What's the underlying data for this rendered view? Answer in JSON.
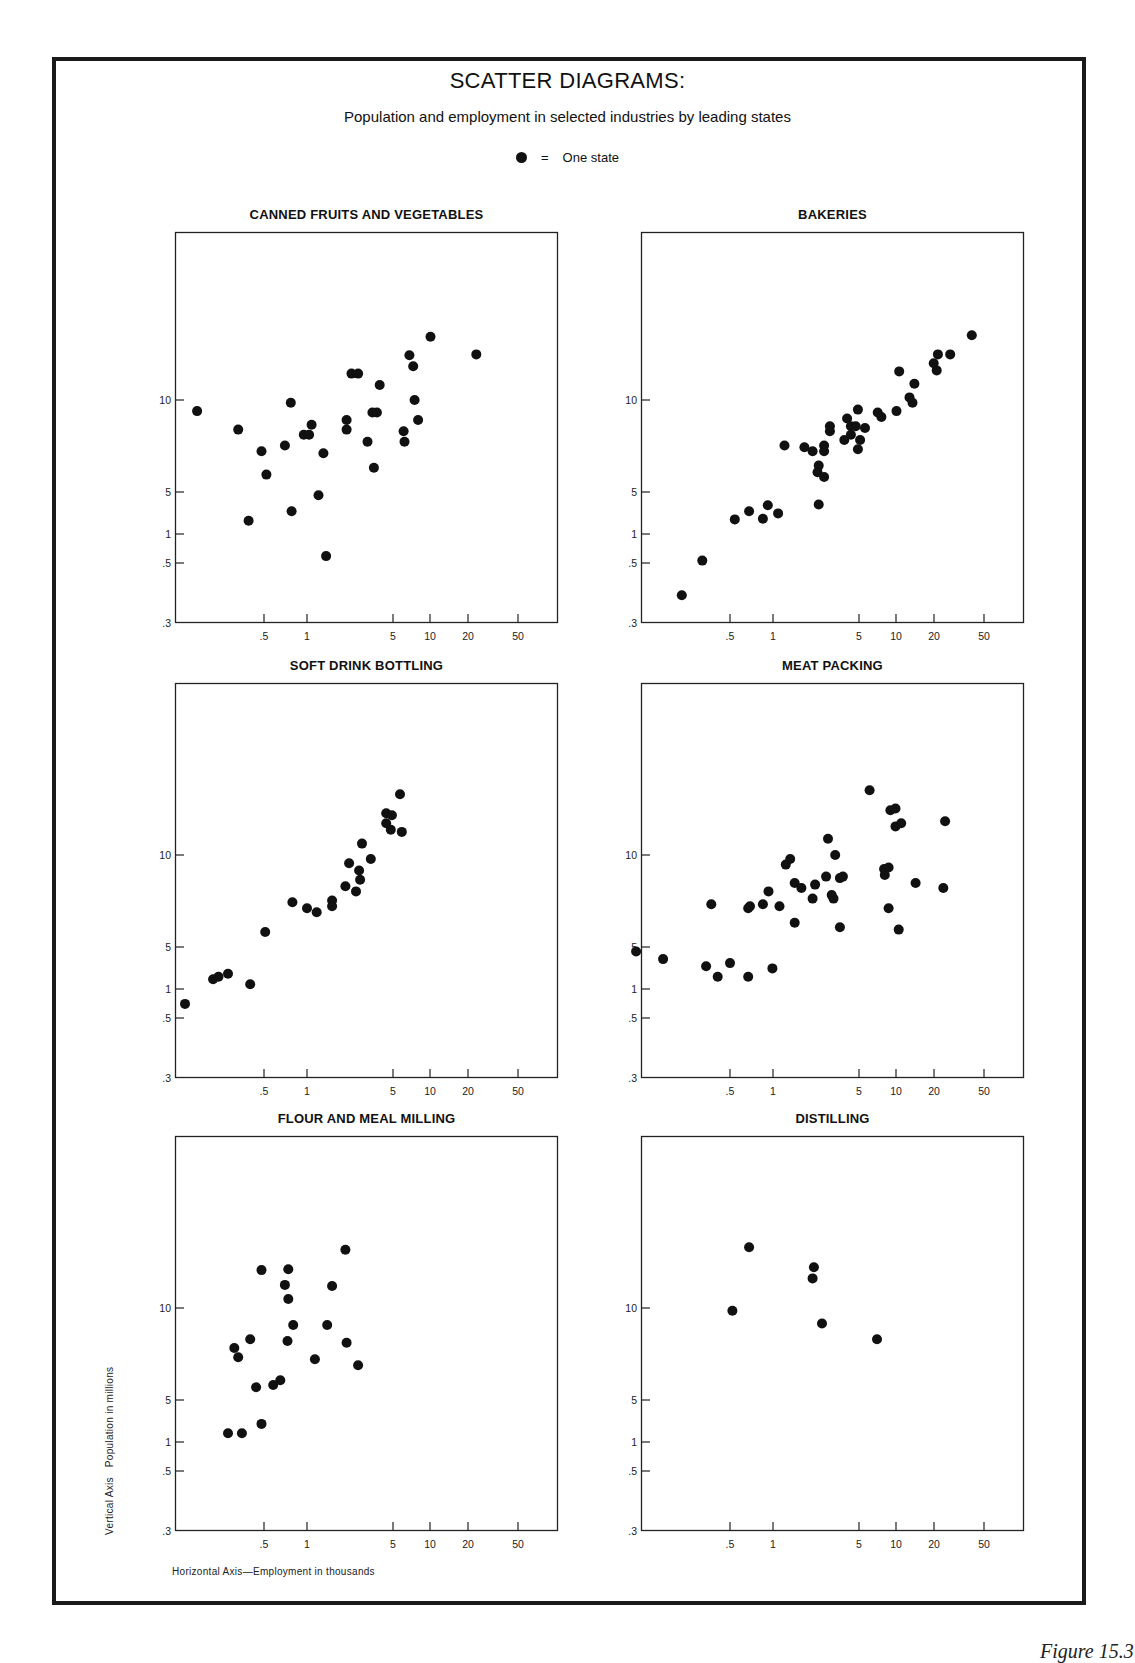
{
  "header": {
    "title": "SCATTER DIAGRAMS:",
    "subtitle": "Population and employment in selected industries by leading states",
    "legend_symbol": "●",
    "legend_equals": "=",
    "legend_label": "One state"
  },
  "axis_labels": {
    "vertical_axis": "Vertical Axis",
    "vertical_desc": "Population in millions",
    "horizontal": "Horizontal Axis—Employment in thousands"
  },
  "figure_caption": "Figure 15.3",
  "colors": {
    "ink": "#111111",
    "frame": "#1a1a1a",
    "background": "#ffffff"
  },
  "chart_data": [
    {
      "type": "scatter",
      "title": "CANNED FRUITS AND VEGETABLES",
      "xlabel": "Employment in thousands",
      "ylabel": "Population in millions",
      "x_ticks": [
        ".5",
        "1",
        "5",
        "10",
        "20",
        "50"
      ],
      "y_ticks": [
        ".3",
        ".5",
        "1",
        "5",
        "10"
      ],
      "points": [
        [
          0.17,
          9.2
        ],
        [
          0.33,
          8.0
        ],
        [
          0.48,
          6.8
        ],
        [
          0.52,
          5.7
        ],
        [
          0.39,
          1.66
        ],
        [
          0.77,
          9.8
        ],
        [
          0.7,
          7.1
        ],
        [
          0.78,
          2.4
        ],
        [
          0.95,
          7.7
        ],
        [
          1.04,
          7.7
        ],
        [
          1.09,
          8.3
        ],
        [
          1.36,
          6.7
        ],
        [
          1.24,
          4.4
        ],
        [
          1.43,
          0.59
        ],
        [
          2.1,
          8.6
        ],
        [
          2.1,
          8.0
        ],
        [
          2.3,
          12.2
        ],
        [
          2.6,
          12.2
        ],
        [
          3.9,
          11.2
        ],
        [
          3.1,
          7.3
        ],
        [
          3.5,
          6.0
        ],
        [
          3.4,
          9.1
        ],
        [
          3.7,
          9.1
        ],
        [
          6.1,
          7.9
        ],
        [
          6.2,
          7.3
        ],
        [
          6.8,
          14.0
        ],
        [
          7.3,
          12.9
        ],
        [
          7.5,
          10.0
        ],
        [
          8.0,
          8.6
        ],
        [
          10.1,
          16.1
        ],
        [
          23.3,
          14.1
        ]
      ]
    },
    {
      "type": "scatter",
      "title": "BAKERIES",
      "xlabel": "Employment in thousands",
      "ylabel": "Population in millions",
      "x_ticks": [
        ".5",
        "1",
        "5",
        "10",
        "20",
        "50"
      ],
      "y_ticks": [
        ".3",
        ".5",
        "1",
        "5",
        "10"
      ],
      "points": [
        [
          0.23,
          0.38
        ],
        [
          0.32,
          0.53
        ],
        [
          0.54,
          1.75
        ],
        [
          0.68,
          2.4
        ],
        [
          0.85,
          1.8
        ],
        [
          0.92,
          3.0
        ],
        [
          1.1,
          2.2
        ],
        [
          1.24,
          7.1
        ],
        [
          1.8,
          7.0
        ],
        [
          2.1,
          6.8
        ],
        [
          2.35,
          3.1
        ],
        [
          2.35,
          6.1
        ],
        [
          2.3,
          5.8
        ],
        [
          2.6,
          5.6
        ],
        [
          2.6,
          7.1
        ],
        [
          2.6,
          6.8
        ],
        [
          2.9,
          8.2
        ],
        [
          2.9,
          7.9
        ],
        [
          3.8,
          7.4
        ],
        [
          4.0,
          8.7
        ],
        [
          4.3,
          8.2
        ],
        [
          4.3,
          7.7
        ],
        [
          4.7,
          8.2
        ],
        [
          4.9,
          6.9
        ],
        [
          5.1,
          7.4
        ],
        [
          4.9,
          9.3
        ],
        [
          5.6,
          8.1
        ],
        [
          7.1,
          9.1
        ],
        [
          7.6,
          8.8
        ],
        [
          10.1,
          9.2
        ],
        [
          10.6,
          12.4
        ],
        [
          12.8,
          10.2
        ],
        [
          13.5,
          9.8
        ],
        [
          14.0,
          11.3
        ],
        [
          19.9,
          13.2
        ],
        [
          21.0,
          12.5
        ],
        [
          21.5,
          14.1
        ],
        [
          26.9,
          14.1
        ],
        [
          40.0,
          16.3
        ]
      ]
    },
    {
      "type": "scatter",
      "title": "SOFT DRINK BOTTLING",
      "xlabel": "Employment in thousands",
      "ylabel": "Population in millions",
      "x_ticks": [
        ".5",
        "1",
        "5",
        "10",
        "20",
        "50"
      ],
      "y_ticks": [
        ".3",
        ".5",
        "1",
        "5",
        "10"
      ],
      "points": [
        [
          0.14,
          0.7
        ],
        [
          0.22,
          1.45
        ],
        [
          0.24,
          1.6
        ],
        [
          0.28,
          1.8
        ],
        [
          0.4,
          1.2
        ],
        [
          0.51,
          5.6
        ],
        [
          0.79,
          7.0
        ],
        [
          1.0,
          6.7
        ],
        [
          1.2,
          6.5
        ],
        [
          1.6,
          7.1
        ],
        [
          1.6,
          6.8
        ],
        [
          2.05,
          7.9
        ],
        [
          2.5,
          7.6
        ],
        [
          2.2,
          9.4
        ],
        [
          2.65,
          8.9
        ],
        [
          2.7,
          8.3
        ],
        [
          2.8,
          10.9
        ],
        [
          3.3,
          9.7
        ],
        [
          5.7,
          15.8
        ],
        [
          4.4,
          13.7
        ],
        [
          4.9,
          13.5
        ],
        [
          4.4,
          12.7
        ],
        [
          4.8,
          12.1
        ],
        [
          5.9,
          11.9
        ]
      ]
    },
    {
      "type": "scatter",
      "title": "MEAT PACKING",
      "xlabel": "Employment in thousands",
      "ylabel": "Population in millions",
      "x_ticks": [
        ".5",
        "1",
        "5",
        "10",
        "20",
        "50"
      ],
      "y_ticks": [
        ".3",
        ".5",
        "1",
        "5",
        "10"
      ],
      "points": [
        [
          0.11,
          4.2
        ],
        [
          0.17,
          3.15
        ],
        [
          0.34,
          2.4
        ],
        [
          0.41,
          1.6
        ],
        [
          0.5,
          2.7
        ],
        [
          0.67,
          1.6
        ],
        [
          0.99,
          2.2
        ],
        [
          0.37,
          6.9
        ],
        [
          0.67,
          6.7
        ],
        [
          0.69,
          6.8
        ],
        [
          0.85,
          6.9
        ],
        [
          0.93,
          7.6
        ],
        [
          1.13,
          6.8
        ],
        [
          1.27,
          9.3
        ],
        [
          1.38,
          9.7
        ],
        [
          1.5,
          8.1
        ],
        [
          1.5,
          6.0
        ],
        [
          1.7,
          7.8
        ],
        [
          2.1,
          7.2
        ],
        [
          2.2,
          8.0
        ],
        [
          2.7,
          8.5
        ],
        [
          2.8,
          11.3
        ],
        [
          3.0,
          7.4
        ],
        [
          3.1,
          7.2
        ],
        [
          3.2,
          10.0
        ],
        [
          3.5,
          5.8
        ],
        [
          3.5,
          8.4
        ],
        [
          3.7,
          8.5
        ],
        [
          6.1,
          16.3
        ],
        [
          8.1,
          8.6
        ],
        [
          8.0,
          9.0
        ],
        [
          8.7,
          9.1
        ],
        [
          8.7,
          6.7
        ],
        [
          9.0,
          14.0
        ],
        [
          9.9,
          14.2
        ],
        [
          9.9,
          12.4
        ],
        [
          11.0,
          12.7
        ],
        [
          10.5,
          5.7
        ],
        [
          14.3,
          8.1
        ],
        [
          23.7,
          7.8
        ],
        [
          24.5,
          12.9
        ]
      ]
    },
    {
      "type": "scatter",
      "title": "FLOUR AND MEAL MILLING",
      "xlabel": "Employment in thousands",
      "ylabel": "Population in millions",
      "x_ticks": [
        ".5",
        "1",
        "5",
        "10",
        "20",
        "50"
      ],
      "y_ticks": [
        ".3",
        ".5",
        "1",
        "5",
        "10"
      ],
      "points": [
        [
          0.28,
          1.4
        ],
        [
          0.35,
          1.4
        ],
        [
          0.48,
          2.0
        ],
        [
          0.44,
          5.5
        ],
        [
          0.58,
          5.6
        ],
        [
          0.65,
          5.8
        ],
        [
          0.31,
          7.4
        ],
        [
          0.33,
          6.9
        ],
        [
          0.4,
          7.9
        ],
        [
          0.48,
          13.3
        ],
        [
          0.74,
          13.4
        ],
        [
          0.7,
          11.9
        ],
        [
          0.74,
          10.7
        ],
        [
          0.8,
          8.8
        ],
        [
          0.73,
          7.8
        ],
        [
          1.16,
          6.8
        ],
        [
          1.46,
          8.8
        ],
        [
          1.6,
          11.8
        ],
        [
          2.05,
          15.5
        ],
        [
          2.1,
          7.7
        ],
        [
          2.6,
          6.5
        ]
      ]
    },
    {
      "type": "scatter",
      "title": "DISTILLING",
      "xlabel": "Employment in thousands",
      "ylabel": "Population in millions",
      "x_ticks": [
        ".5",
        "1",
        "5",
        "10",
        "20",
        "50"
      ],
      "y_ticks": [
        ".3",
        ".5",
        "1",
        "5",
        "10"
      ],
      "points": [
        [
          0.68,
          15.8
        ],
        [
          0.52,
          9.8
        ],
        [
          2.15,
          13.6
        ],
        [
          2.1,
          12.5
        ],
        [
          2.5,
          8.9
        ],
        [
          7.0,
          7.9
        ]
      ]
    }
  ]
}
